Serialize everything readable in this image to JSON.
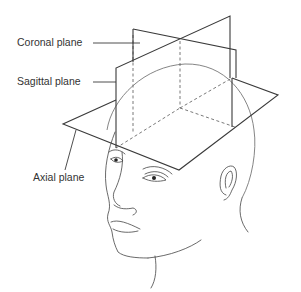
{
  "diagram": {
    "labels": {
      "coronal": "Coronal plane",
      "sagittal": "Sagittal plane",
      "axial": "Axial plane"
    },
    "colors": {
      "line": "#3a3a3a",
      "dashed": "#6a6a6a",
      "text": "#333333",
      "background": "#ffffff"
    }
  }
}
